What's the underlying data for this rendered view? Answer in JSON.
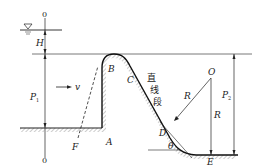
{
  "diagram": {
    "type": "spillway-weir-profile",
    "reference_line": {
      "top_label": "0",
      "bottom_label": "0"
    },
    "water_surface_symbol": "∇",
    "labels": {
      "H": "H",
      "P1": "P",
      "P1_sub": "1",
      "P2": "P",
      "P2_sub": "2",
      "v": "v",
      "A": "A",
      "B": "B",
      "C": "C",
      "D": "D",
      "E": "E",
      "F": "F",
      "O": "O",
      "R1": "R",
      "R2": "R",
      "theta": "θ",
      "straight_segment_1": "直",
      "straight_segment_2": "线",
      "straight_segment_3": "段"
    },
    "colors": {
      "line": "#222222",
      "hatch": "#999999",
      "background": "#ffffff"
    }
  }
}
